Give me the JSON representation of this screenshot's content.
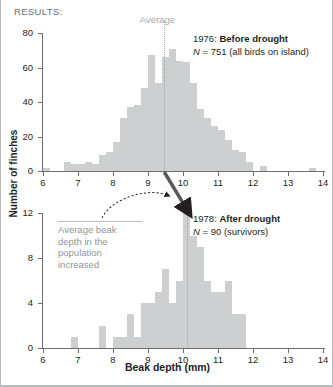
{
  "header": {
    "results_label": "RESULTS:"
  },
  "axes": {
    "xlabel": "Beak depth (mm)",
    "ylabel": "Number of finches",
    "xticks": [
      6,
      7,
      8,
      9,
      10,
      11,
      12,
      13,
      14
    ],
    "top_yticks": [
      0,
      20,
      40,
      60,
      80
    ],
    "bottom_yticks": [
      0,
      4,
      8,
      12
    ]
  },
  "average_marker": {
    "label": "Average"
  },
  "annotation": {
    "lines": [
      "Average beak",
      "depth in the",
      "population",
      "increased"
    ],
    "text": "Average beak depth in the population increased"
  },
  "legends": {
    "top": {
      "year": "1976:",
      "condition": "Before drought",
      "n_prefix": "N",
      "n_eq": "= 751 (all birds on island)"
    },
    "bottom": {
      "year": "1978:",
      "condition": "After drought",
      "n_prefix": "N",
      "n_eq": "= 90 (survivors)"
    }
  },
  "chart_data": [
    {
      "type": "bar",
      "title": "1976: Before drought",
      "subtitle": "N = 751 (all birds on island)",
      "xlabel": "Beak depth (mm)",
      "ylabel": "Number of finches",
      "xlim": [
        6,
        14
      ],
      "ylim": [
        0,
        80
      ],
      "bin_width": 0.2,
      "grid": false,
      "average": 9.45,
      "average_label": "Average",
      "n": 751,
      "x": [
        6.0,
        6.2,
        6.4,
        6.6,
        6.8,
        7.0,
        7.2,
        7.4,
        7.6,
        7.8,
        8.0,
        8.2,
        8.4,
        8.6,
        8.8,
        9.0,
        9.2,
        9.4,
        9.6,
        9.8,
        10.0,
        10.2,
        10.4,
        10.6,
        10.8,
        11.0,
        11.2,
        11.4,
        11.6,
        11.8,
        12.0,
        12.2,
        12.4,
        12.6,
        12.8,
        13.0,
        13.2,
        13.4,
        13.6,
        13.8
      ],
      "values": [
        2,
        0,
        0,
        5,
        4,
        4,
        5,
        4,
        9,
        11,
        17,
        31,
        37,
        38,
        48,
        67,
        51,
        66,
        71,
        64,
        63,
        51,
        36,
        31,
        26,
        24,
        18,
        12,
        11,
        5,
        0,
        3,
        0,
        0,
        0,
        0,
        0,
        0,
        2,
        0
      ]
    },
    {
      "type": "bar",
      "title": "1978: After drought",
      "subtitle": "N = 90 (survivors)",
      "xlabel": "Beak depth (mm)",
      "ylabel": "Number of finches",
      "xlim": [
        6,
        14
      ],
      "ylim": [
        0,
        12
      ],
      "bin_width": 0.2,
      "grid": false,
      "average": 10.1,
      "n": 90,
      "x": [
        6.0,
        6.2,
        6.4,
        6.6,
        6.8,
        7.0,
        7.2,
        7.4,
        7.6,
        7.8,
        8.0,
        8.2,
        8.4,
        8.6,
        8.8,
        9.0,
        9.2,
        9.4,
        9.6,
        9.8,
        10.0,
        10.2,
        10.4,
        10.6,
        10.8,
        11.0,
        11.2,
        11.4,
        11.6,
        11.8,
        12.0,
        12.2,
        12.4,
        12.6,
        12.8,
        13.0,
        13.2,
        13.4,
        13.6,
        13.8
      ],
      "values": [
        0,
        0,
        0,
        0,
        1,
        0,
        0,
        0,
        2,
        0,
        1,
        1,
        3,
        1,
        4,
        4,
        5,
        7,
        4,
        6,
        12,
        10,
        9,
        6,
        5,
        5,
        6,
        3,
        3,
        0,
        0,
        0,
        0,
        0,
        0,
        0,
        0,
        0,
        0,
        0
      ]
    }
  ]
}
